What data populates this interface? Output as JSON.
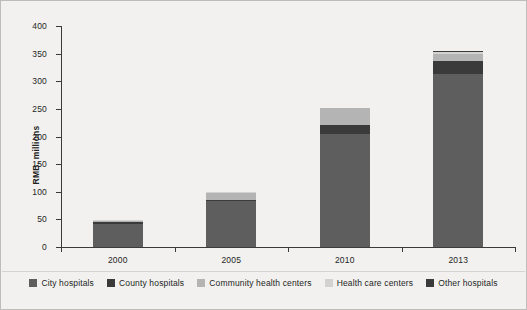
{
  "chart_data": {
    "type": "bar",
    "subtype": "stacked-bar",
    "title": "",
    "xlabel": "",
    "ylabel": "RMB, millions",
    "categories": [
      "2000",
      "2005",
      "2010",
      "2013"
    ],
    "ylim": [
      0,
      400
    ],
    "yticks": [
      0,
      50,
      100,
      150,
      200,
      250,
      300,
      350,
      400
    ],
    "ytick_labels": [
      "0",
      "50",
      "100",
      "150",
      "200",
      "250",
      "300",
      "350",
      "400"
    ],
    "grid": false,
    "legend_position": "bottom",
    "series": [
      {
        "name": "City hospitals",
        "color": "#5e5e5e",
        "values": [
          42,
          83,
          205,
          314
        ]
      },
      {
        "name": "County hospitals",
        "color": "#3a3a3a",
        "values": [
          4,
          3,
          16,
          23
        ]
      },
      {
        "name": "Community health centers",
        "color": "#b4b4b4",
        "values": [
          2,
          12,
          30,
          13
        ]
      },
      {
        "name": "Health care centers",
        "color": "#d2d2d2",
        "values": [
          1,
          1,
          1,
          3
        ]
      },
      {
        "name": "Other hospitals",
        "color": "#3a3a3a",
        "values": [
          0,
          0,
          0,
          1
        ]
      }
    ],
    "totals": [
      49,
      99,
      252,
      354
    ]
  },
  "legend": {
    "items": [
      {
        "label": "City hospitals",
        "color": "#5e5e5e"
      },
      {
        "label": "County hospitals",
        "color": "#3a3a3a"
      },
      {
        "label": "Community health centers",
        "color": "#b4b4b4"
      },
      {
        "label": "Health care centers",
        "color": "#d2d2d2"
      },
      {
        "label": "Other hospitals",
        "color": "#3a3a3a"
      }
    ]
  },
  "colors": {
    "background": "#f2f1ef",
    "axis": "#3a3a3a",
    "text": "#231f1e"
  }
}
